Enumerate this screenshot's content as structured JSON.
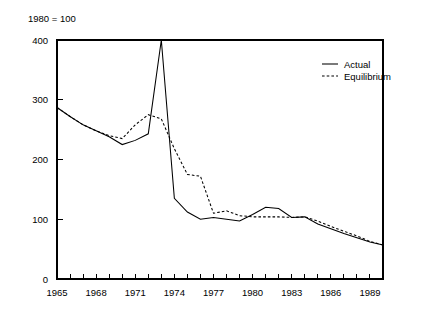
{
  "figure": {
    "note": "1980 = 100",
    "background_color": "#ffffff",
    "ink_color": "#000000"
  },
  "legend": {
    "position": "upper-right",
    "entries": [
      {
        "label": "Actual",
        "style": "solid",
        "icon": "solid-line-swatch"
      },
      {
        "label": "Equilibrium",
        "style": "dashed",
        "icon": "dashed-line-swatch"
      }
    ]
  },
  "axes": {
    "y": {
      "tick_labels": [
        "0",
        "100",
        "200",
        "300",
        "400"
      ],
      "tick_values": [
        0,
        100,
        200,
        300,
        400
      ],
      "min": 0,
      "max": 400
    },
    "x": {
      "tick_labels": [
        "1965",
        "1968",
        "1971",
        "1974",
        "1977",
        "1980",
        "1983",
        "1986",
        "1989"
      ],
      "tick_values": [
        1965,
        1968,
        1971,
        1974,
        1977,
        1980,
        1983,
        1986,
        1989
      ],
      "minor_tick_values": [
        1965,
        1966,
        1967,
        1968,
        1969,
        1970,
        1971,
        1972,
        1973,
        1974,
        1975,
        1976,
        1977,
        1978,
        1979,
        1980,
        1981,
        1982,
        1983,
        1984,
        1985,
        1986,
        1987,
        1988,
        1989,
        1990
      ],
      "min": 1965,
      "max": 1990
    }
  },
  "chart_data": {
    "type": "line",
    "title": "1980 = 100",
    "xlabel": "",
    "ylabel": "",
    "xlim": [
      1965,
      1990
    ],
    "ylim": [
      0,
      400
    ],
    "grid": false,
    "legend_position": "upper right",
    "annotations": [
      "1980 = 100"
    ],
    "x": [
      1965,
      1966,
      1967,
      1968,
      1969,
      1970,
      1971,
      1972,
      1973,
      1974,
      1975,
      1976,
      1977,
      1978,
      1979,
      1980,
      1981,
      1982,
      1983,
      1984,
      1985,
      1986,
      1987,
      1988,
      1989,
      1990
    ],
    "series": [
      {
        "name": "Actual",
        "style": "solid",
        "values": [
          287,
          272,
          258,
          248,
          238,
          225,
          232,
          243,
          400,
          135,
          112,
          100,
          103,
          100,
          97,
          108,
          120,
          118,
          103,
          104,
          92,
          84,
          76,
          69,
          62,
          57
        ]
      },
      {
        "name": "Equilibrium",
        "style": "dashed",
        "values": [
          287,
          272,
          258,
          248,
          240,
          235,
          258,
          275,
          268,
          218,
          175,
          172,
          110,
          114,
          106,
          104,
          104,
          104,
          103,
          104,
          97,
          88,
          80,
          72,
          63,
          57
        ]
      }
    ]
  }
}
